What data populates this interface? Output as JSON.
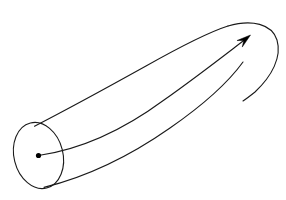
{
  "figure": {
    "kind": "geometric-diagram",
    "background_color": "#ffffff",
    "stroke_color": "#1a1a1a",
    "dot_color": "#000000",
    "canvas": {
      "width": 286,
      "height": 200
    }
  },
  "geometry": {
    "end_cap_ellipse": {
      "name": "left-end-cross-section",
      "center_x": 38.5,
      "center_y": 155.5,
      "radius_x": 24.5,
      "radius_y": 33.5,
      "rotation_deg": -14
    },
    "center_dot": {
      "name": "axis-origin-point",
      "cx": 38.5,
      "cy": 155.5,
      "r": 2.6
    },
    "upper_boundary_path": "M 34.5 126.2 C 70 108 110 86 146 66 C 178 48 206 33 228 26",
    "lower_boundary_path": "M 44.0 187.4 C 86 177 130 156 170 128 C 206 103 230 80 243 62",
    "right_cap_path": "M 228 26 C 252 19 272 24 277 40 C 282 57 272 76 255 92 C 250 96 246 99 243 101",
    "center_axis_path": "M 38.5 155.5 C 84 149 126 128 164 100 C 198 76 226 54 247 38",
    "arrow_head": {
      "tip_x": 250.5,
      "tip_y": 35.0,
      "angle_deg": -39,
      "length": 14,
      "half_width": 4.2
    }
  },
  "chart_data": {
    "type": "diagram",
    "elements": [
      {
        "name": "left-end-cross-section",
        "shape": "ellipse",
        "description": "Tilted ellipse forming the near circular end cap of the tube"
      },
      {
        "name": "axis-origin-point",
        "shape": "dot",
        "description": "Filled point marking the center of the near cross-section"
      },
      {
        "name": "upper-boundary",
        "shape": "curve",
        "description": "Upper silhouette edge of the tube sweeping up to the right"
      },
      {
        "name": "lower-boundary",
        "shape": "curve",
        "description": "Lower silhouette edge of the tube sweeping up to the right"
      },
      {
        "name": "right-end-cap",
        "shape": "curve",
        "description": "Rounded far end joining the upper and lower boundaries"
      },
      {
        "name": "center-axis-arrow",
        "shape": "arrow",
        "description": "Curved directed axis from the center dot to the far end, pointing up and to the right"
      }
    ],
    "labels": [],
    "annotations": [],
    "legend": [],
    "grid": false
  }
}
